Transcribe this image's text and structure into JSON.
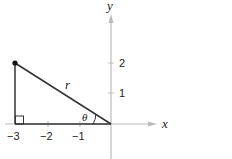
{
  "axes": {
    "x_label": "x",
    "y_label": "y",
    "x_ticks": [
      "−3",
      "−2",
      "−1"
    ],
    "y_ticks": [
      "2",
      "1"
    ],
    "axis_color": "#bbbbbb"
  },
  "triangle": {
    "point": "(-3, 2)",
    "hypotenuse_label": "r",
    "angle_label": "θ",
    "line_color": "#333333",
    "right_angle_marker": true
  }
}
